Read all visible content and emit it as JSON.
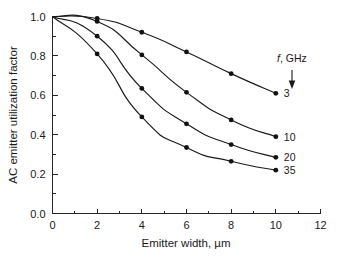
{
  "chart_data": {
    "type": "line",
    "title": "",
    "subtitle": "",
    "xlabel": "Emitter width, µm",
    "ylabel": "AC emitter utilization factor",
    "xlim": [
      0,
      12
    ],
    "ylim": [
      0.0,
      1.0
    ],
    "x_major_ticks": [
      0,
      2,
      4,
      6,
      8,
      10,
      12
    ],
    "x_major_tick_labels": [
      "0",
      "2",
      "4",
      "6",
      "8",
      "10",
      "12"
    ],
    "x_minor_ticks": [
      1,
      3,
      5,
      7,
      9,
      11
    ],
    "y_major_ticks": [
      0.0,
      0.2,
      0.4,
      0.6,
      0.8,
      1.0
    ],
    "y_major_tick_labels": [
      "0.0",
      "0.2",
      "0.4",
      "0.6",
      "0.8",
      "1.0"
    ],
    "y_minor_ticks": [
      0.1,
      0.3,
      0.5,
      0.7,
      0.9
    ],
    "grid": false,
    "legend_position": "inside-right",
    "legend_title_italic": "f",
    "legend_title_rest": ", GHz",
    "legend_arrow": "down-arrow",
    "x": [
      0,
      2,
      4,
      6,
      8,
      10
    ],
    "series": [
      {
        "name": "3",
        "label": "3",
        "values": [
          1.0,
          0.99,
          0.92,
          0.82,
          0.71,
          0.61
        ],
        "marker": "filled-circle",
        "color": "#111111"
      },
      {
        "name": "10",
        "label": "10",
        "values": [
          1.0,
          0.975,
          0.805,
          0.615,
          0.475,
          0.39
        ],
        "marker": "filled-circle",
        "color": "#111111"
      },
      {
        "name": "20",
        "label": "20",
        "values": [
          1.0,
          0.9,
          0.635,
          0.455,
          0.35,
          0.285
        ],
        "marker": "filled-circle",
        "color": "#111111"
      },
      {
        "name": "35",
        "label": "35",
        "values": [
          1.0,
          0.81,
          0.49,
          0.335,
          0.265,
          0.22
        ],
        "marker": "filled-circle",
        "color": "#111111"
      }
    ]
  },
  "figure": {
    "background_color": "#ffffff",
    "axis_color": "#262626",
    "text_color": "#1a1a1a"
  }
}
